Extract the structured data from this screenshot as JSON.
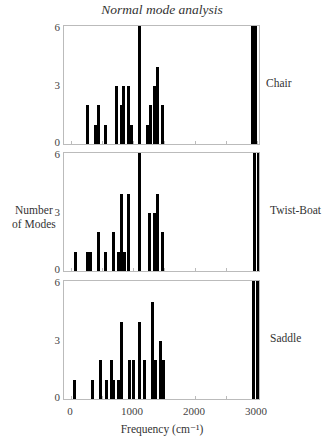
{
  "chart_data": {
    "type": "bar",
    "title": "Normal mode analysis",
    "xlabel": "Frequency (cm⁻¹)",
    "ylabel": "Number of Modes",
    "xlim": [
      -100,
      3100
    ],
    "ylim": [
      0,
      6
    ],
    "x_ticks": [
      0,
      1000,
      2000,
      3000
    ],
    "y_ticks": [
      0,
      3,
      6
    ],
    "grid": false,
    "panels": [
      {
        "name": "Chair",
        "x": [
          260,
          390,
          440,
          560,
          740,
          810,
          850,
          920,
          980,
          1100,
          1230,
          1290,
          1340,
          1400,
          1470,
          2920,
          2980
        ],
        "values": [
          2,
          1,
          2,
          1,
          3,
          2,
          3,
          3,
          1,
          6,
          1,
          2,
          3,
          4,
          2,
          6,
          6
        ]
      },
      {
        "name": "Twist-Boat",
        "x": [
          80,
          260,
          320,
          450,
          560,
          690,
          760,
          810,
          870,
          920,
          1100,
          1270,
          1340,
          1400,
          1470,
          2960,
          3020
        ],
        "values": [
          1,
          1,
          1,
          2,
          1,
          2,
          1,
          4,
          1,
          4,
          6,
          3,
          3,
          4,
          2,
          6,
          6
        ]
      },
      {
        "name": "Saddle",
        "x": [
          50,
          350,
          470,
          580,
          650,
          690,
          760,
          820,
          940,
          1000,
          1110,
          1180,
          1310,
          1370,
          1440,
          1490,
          2940,
          3000
        ],
        "values": [
          1,
          1,
          2,
          1,
          2,
          1,
          1,
          4,
          2,
          2,
          4,
          2,
          5,
          2,
          3,
          2,
          6,
          6
        ]
      }
    ]
  },
  "labels": {
    "title": "Normal mode analysis",
    "xlabel": "Frequency  (cm⁻¹)",
    "ylabel_line1": "Number",
    "ylabel_line2": "of Modes",
    "panel_names": [
      "Chair",
      "Twist-Boat",
      "Saddle"
    ],
    "y_ticks": [
      "6",
      "3",
      "0"
    ],
    "x_ticks": [
      "0",
      "1000",
      "2000",
      "3000"
    ]
  }
}
